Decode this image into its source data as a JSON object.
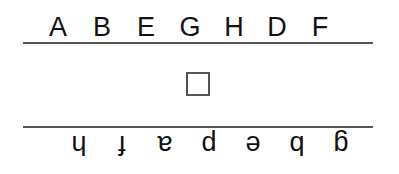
{
  "top_letters": [
    "A",
    "B",
    "E",
    "G",
    "H",
    "D",
    "F"
  ],
  "bottom_letters_rotated_180": [
    "g",
    "b",
    "e",
    "p",
    "a",
    "f",
    "h"
  ],
  "answer_box": {
    "value": ""
  }
}
